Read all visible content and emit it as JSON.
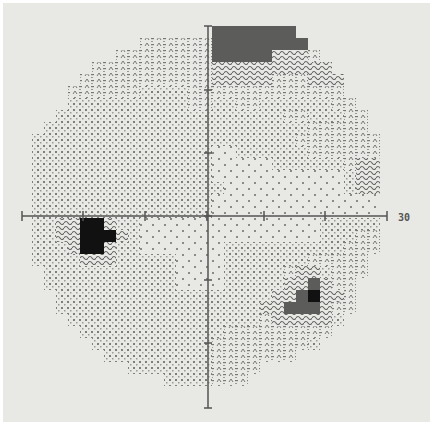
{
  "chart_data": {
    "type": "heatmap",
    "title": "",
    "xlabel": "",
    "ylabel": "",
    "axis_extent_label": "30",
    "xlim": [
      -30,
      30
    ],
    "ylim": [
      -30,
      30
    ],
    "tick_spacing_deg": 10,
    "grid": false,
    "legend": "none",
    "center_px": [
      207,
      216
    ],
    "px_per_10deg": 61,
    "cell_px": 12,
    "grid_origin_px": [
      20,
      26
    ],
    "levels": {
      "0": "blank",
      "1": "sparse dots (high sensitivity)",
      "2": "dense dots",
      "3": "dash-lambda pattern",
      "4": "wavy dense pattern",
      "5": "dark grey block",
      "6": "black (absolute defect)"
    },
    "rows": [
      "0000000000000000555555500000000",
      "0000000000333333555555550000000",
      "0000000033333333555554443000000",
      "0000003333333333444444444400000",
      "0000033333333333444443334440000",
      "0000333333222233333333333330000",
      "0000222222222233223322222233000",
      "0002222222222222222222332223300",
      "0022222222222222222222223333300",
      "0222222222222222222222233333330",
      "0222222222222222112222223333330",
      "0222222222222222111112222223440",
      "0222222222222222111111111112440",
      "0222222222222222211111111112440",
      "0222222222222222111111111111110",
      "0222222222222222111111111111110",
      "0224466422111111111111111222220",
      "0224466642111111111111111222330",
      "0222466422111111122222222223330",
      "0222244422222111122222223333300",
      "0022222222222111122222344233300",
      "0022222222222111122222445433000",
      "0002222222222222222224456443000",
      "0002222222222222222244555433000",
      "0000222222222222222234444420000",
      "0000022222222222233333333300000",
      "0000002222222222333333332000000",
      "0000000222222222333333300000000",
      "0000000002222222333300000000000",
      "0000000000002222333000000000000",
      "0000000000000000000000000000000",
      "0000000000000000000000000000000"
    ]
  },
  "axes": {
    "h_ticks_px": [
      22,
      83,
      145,
      207,
      264,
      325,
      387
    ],
    "v_ticks_px": [
      26,
      90,
      153,
      216,
      280,
      343,
      408
    ]
  },
  "colors": {
    "background": "#e8e8e4",
    "axis": "#555555",
    "dot": "#8a8a88",
    "dense": "#7a7a78",
    "wavy": "#6a6a68",
    "dark": "#5c5c5a",
    "black": "#111111"
  }
}
